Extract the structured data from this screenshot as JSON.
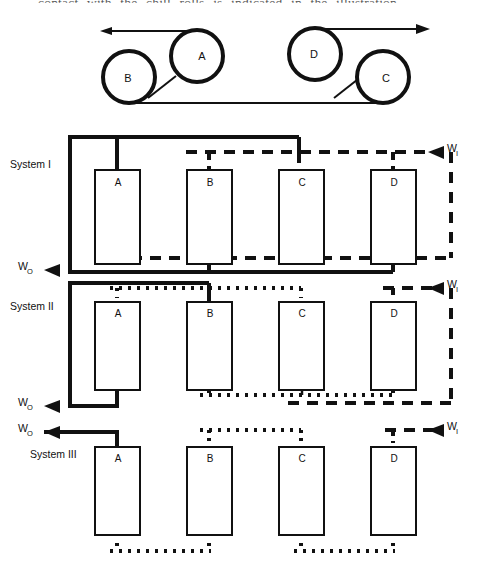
{
  "page": {
    "truncated_caption": "contact with the chill rolls is indicated in the illustration",
    "background_color": "#ffffff",
    "line_color": "#111111"
  },
  "roll_diagram": {
    "name": "chill-roll-threading-diagram",
    "rolls": [
      {
        "label": "A",
        "cx": 197,
        "cy": 56,
        "r": 26
      },
      {
        "label": "B",
        "cx": 129,
        "cy": 77,
        "r": 26
      },
      {
        "label": "D",
        "cx": 315,
        "cy": 54,
        "r": 26
      },
      {
        "label": "C",
        "cx": 383,
        "cy": 77,
        "r": 26
      }
    ],
    "web_in_arrow": "left-arrow-head",
    "web_out_arrow": "right-arrow-head"
  },
  "systems": [
    {
      "id": "system-1",
      "label": "System I",
      "label_x": 10,
      "label_y": 165,
      "units": [
        {
          "label": "A",
          "x": 95,
          "y": 170,
          "w": 45,
          "h": 94
        },
        {
          "label": "B",
          "x": 187,
          "y": 170,
          "w": 45,
          "h": 94
        },
        {
          "label": "C",
          "x": 279,
          "y": 170,
          "w": 45,
          "h": 94
        },
        {
          "label": "D",
          "x": 371,
          "y": 170,
          "w": 45,
          "h": 94
        }
      ],
      "inlet_label": "W",
      "inlet_subscript": "I",
      "outlet_label": "W",
      "outlet_subscript": "O",
      "solid_stream": "product-stream",
      "dashed_stream": "water-stream"
    },
    {
      "id": "system-2",
      "label": "System II",
      "label_x": 10,
      "label_y": 307,
      "units": [
        {
          "label": "A",
          "x": 95,
          "y": 302,
          "w": 45,
          "h": 88
        },
        {
          "label": "B",
          "x": 187,
          "y": 302,
          "w": 45,
          "h": 88
        },
        {
          "label": "C",
          "x": 279,
          "y": 302,
          "w": 45,
          "h": 88
        },
        {
          "label": "D",
          "x": 371,
          "y": 302,
          "w": 45,
          "h": 88
        }
      ],
      "inlet_label": "W",
      "inlet_subscript": "I",
      "outlet_label": "W",
      "outlet_subscript": "O",
      "solid_stream": "product-stream",
      "dashed_stream": "water-stream",
      "dotted_stream": "recycle-stream"
    },
    {
      "id": "system-3",
      "label": "System III",
      "label_x": 30,
      "label_y": 455,
      "units": [
        {
          "label": "A",
          "x": 95,
          "y": 447,
          "w": 45,
          "h": 88
        },
        {
          "label": "B",
          "x": 187,
          "y": 447,
          "w": 45,
          "h": 88
        },
        {
          "label": "C",
          "x": 279,
          "y": 447,
          "w": 45,
          "h": 88
        },
        {
          "label": "D",
          "x": 371,
          "y": 447,
          "w": 45,
          "h": 88
        }
      ],
      "inlet_label": "W",
      "inlet_subscript": "I",
      "outlet_label": "W",
      "outlet_subscript": "O",
      "solid_stream": "product-stream",
      "dashed_stream": "water-stream",
      "dotted_stream": "recycle-stream"
    }
  ],
  "labels": {
    "w_in": "W",
    "w_in_sub": "I",
    "w_out": "W",
    "w_out_sub": "O"
  }
}
